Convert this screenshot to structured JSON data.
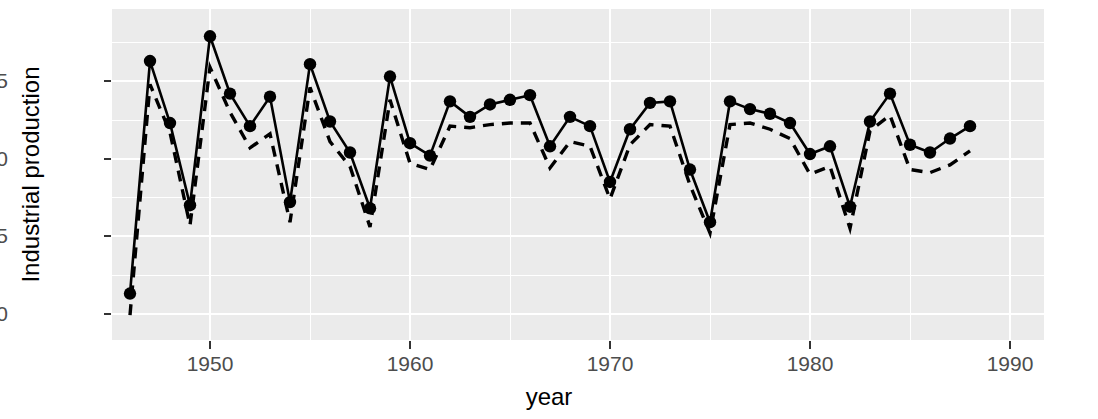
{
  "chart_data": {
    "type": "line",
    "title": "",
    "xlabel": "year",
    "ylabel": "Industrial production",
    "xlim": [
      1945.1,
      1991.7
    ],
    "ylim": [
      -5.85,
      4.83
    ],
    "grid": true,
    "legend": "none",
    "x_ticks": [
      1950,
      1960,
      1970,
      1980,
      1990
    ],
    "x_tick_labels": [
      "1950",
      "1960",
      "1970",
      "1980",
      "1990"
    ],
    "y_ticks": [
      2.5,
      0.0,
      -2.5,
      -5.0
    ],
    "y_tick_labels": [
      "2.5",
      "0.0",
      "-2.5",
      "-5.0"
    ],
    "x": [
      1946,
      1947,
      1948,
      1949,
      1950,
      1951,
      1952,
      1953,
      1954,
      1955,
      1956,
      1957,
      1958,
      1959,
      1960,
      1961,
      1962,
      1963,
      1964,
      1965,
      1966,
      1967,
      1968,
      1969,
      1970,
      1971,
      1972,
      1973,
      1974,
      1975,
      1976,
      1977,
      1978,
      1979,
      1980,
      1981,
      1982,
      1983,
      1984,
      1985,
      1986,
      1987,
      1988
    ],
    "series": [
      {
        "name": "observed",
        "style": "solid",
        "markers": true,
        "color": "#000000",
        "values": [
          -4.35,
          3.15,
          1.15,
          -1.5,
          3.95,
          2.1,
          1.05,
          2.0,
          -1.4,
          3.05,
          1.2,
          0.2,
          -1.6,
          2.65,
          0.5,
          0.1,
          1.85,
          1.35,
          1.75,
          1.9,
          2.05,
          0.4,
          1.35,
          1.05,
          -0.75,
          0.95,
          1.8,
          1.85,
          -0.35,
          -2.05,
          1.85,
          1.6,
          1.45,
          1.15,
          0.15,
          0.4,
          -1.55,
          1.2,
          2.1,
          0.45,
          0.2,
          0.65,
          1.05
        ]
      },
      {
        "name": "fitted",
        "style": "dashed",
        "markers": false,
        "color": "#000000",
        "values": [
          -5.05,
          2.4,
          0.85,
          -2.15,
          2.95,
          1.5,
          0.35,
          0.8,
          -2.05,
          2.3,
          0.55,
          -0.25,
          -2.2,
          1.9,
          -0.15,
          -0.35,
          1.05,
          1.0,
          1.1,
          1.15,
          1.15,
          -0.3,
          0.55,
          0.4,
          -1.3,
          0.45,
          1.1,
          1.05,
          -0.85,
          -2.4,
          1.1,
          1.15,
          0.95,
          0.65,
          -0.5,
          -0.25,
          -2.25,
          0.9,
          1.4,
          -0.35,
          -0.45,
          -0.2,
          0.25
        ]
      }
    ]
  }
}
